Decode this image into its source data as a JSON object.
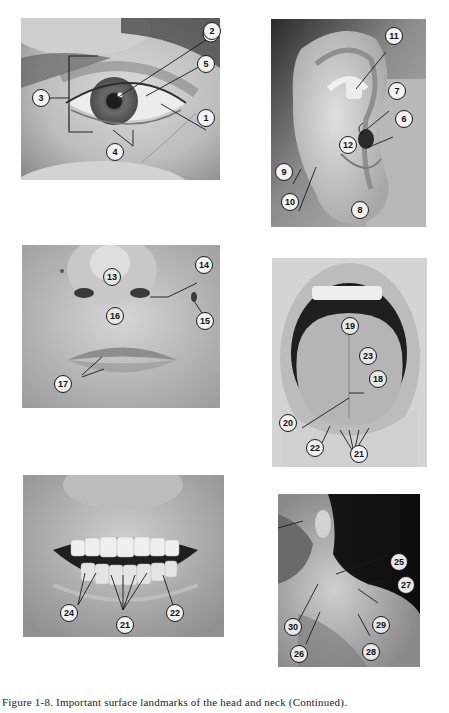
{
  "figure": {
    "caption": "Figure 1-8. Important surface landmarks of the head and neck (Continued)."
  },
  "panels": [
    {
      "id": "eye",
      "subject": "Eye",
      "callouts": [
        {
          "label": "1"
        },
        {
          "label": "2"
        },
        {
          "label": "3"
        },
        {
          "label": "4"
        },
        {
          "label": "5"
        }
      ]
    },
    {
      "id": "ear",
      "subject": "Ear",
      "callouts": [
        {
          "label": "6"
        },
        {
          "label": "7"
        },
        {
          "label": "8"
        },
        {
          "label": "9"
        },
        {
          "label": "10"
        },
        {
          "label": "11"
        },
        {
          "label": "12"
        }
      ]
    },
    {
      "id": "nose-lips",
      "subject": "Nose and lips",
      "callouts": [
        {
          "label": "13"
        },
        {
          "label": "14"
        },
        {
          "label": "15"
        },
        {
          "label": "16"
        },
        {
          "label": "17"
        }
      ]
    },
    {
      "id": "tongue",
      "subject": "Open mouth and tongue",
      "callouts": [
        {
          "label": "18"
        },
        {
          "label": "19"
        },
        {
          "label": "20"
        },
        {
          "label": "21"
        },
        {
          "label": "22"
        },
        {
          "label": "23"
        }
      ]
    },
    {
      "id": "teeth",
      "subject": "Teeth",
      "callouts": [
        {
          "label": "24"
        },
        {
          "label": "21"
        },
        {
          "label": "22"
        }
      ]
    },
    {
      "id": "neck",
      "subject": "Neck",
      "callouts": [
        {
          "label": "25"
        },
        {
          "label": "26"
        },
        {
          "label": "27"
        },
        {
          "label": "28"
        },
        {
          "label": "29"
        },
        {
          "label": "30"
        }
      ]
    }
  ],
  "style": {
    "callout_stroke": "#1a1a1a",
    "callout_fill": "#f2f2f2",
    "callout_fill_dark": "#e8e8e8"
  }
}
